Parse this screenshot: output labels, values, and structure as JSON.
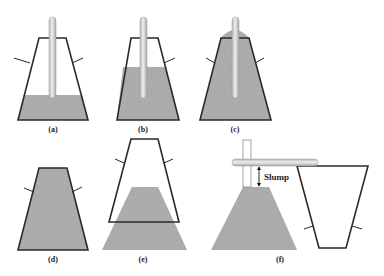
{
  "figure": {
    "panels": [
      {
        "id": "a",
        "label": "(a)",
        "description": "Cone filled to 1/3 height, rodded"
      },
      {
        "id": "b",
        "label": "(b)",
        "description": "Cone filled to 2/3 height, rodded"
      },
      {
        "id": "c",
        "label": "(c)",
        "description": "Cone overfilled, rodded"
      },
      {
        "id": "d",
        "label": "(d)",
        "description": "Cone full, leveled"
      },
      {
        "id": "e",
        "label": "(e)",
        "description": "Cone lifted, concrete slumps"
      },
      {
        "id": "f",
        "label": "(f)",
        "description": "Slump measured against inverted cone with rod"
      }
    ],
    "annotation": {
      "slump_label": "Slump"
    },
    "colors": {
      "outline": "#2a2a2a",
      "concrete": "#9a9a9a",
      "rod": "#d0d0d0",
      "background": "#ffffff"
    }
  }
}
